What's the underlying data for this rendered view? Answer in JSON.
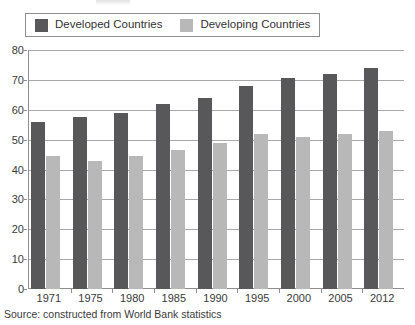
{
  "legend": {
    "position": "top-left",
    "entries": [
      {
        "label": "Developed Countries",
        "color": "#58585a",
        "icon": "legend-swatch-icon"
      },
      {
        "label": "Developing Countries",
        "color": "#b8b8b8",
        "icon": "legend-swatch-icon"
      }
    ]
  },
  "source_note": "Source: constructed from World Bank statistics",
  "chart_data": {
    "type": "bar",
    "title": "",
    "subtitle": "",
    "xlabel": "",
    "ylabel": "",
    "categories": [
      "1971",
      "1975",
      "1980",
      "1985",
      "1990",
      "1995",
      "2000",
      "2005",
      "2012"
    ],
    "series": [
      {
        "name": "Developed Countries",
        "color": "#58585a",
        "values": [
          56,
          57.5,
          59,
          62,
          64,
          68,
          70.5,
          72,
          74
        ]
      },
      {
        "name": "Developing Countries",
        "color": "#b8b8b8",
        "values": [
          44.5,
          43,
          44.5,
          46.5,
          49,
          52,
          51,
          52,
          53
        ]
      }
    ],
    "ylim": [
      0,
      80
    ],
    "yticks": [
      0,
      10,
      20,
      30,
      40,
      50,
      60,
      70,
      80
    ],
    "ytick_labels": [
      "0",
      "10",
      "20",
      "30",
      "40",
      "50",
      "60",
      "70",
      "80"
    ],
    "grid": true,
    "grid_axis": "y",
    "legend_position": "top-left"
  }
}
